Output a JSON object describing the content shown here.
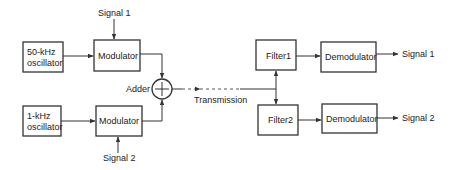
{
  "diagram": {
    "title": "",
    "blocks": {
      "osc1": {
        "line1": "50-kHz",
        "line2": "oscillator"
      },
      "osc2": {
        "line1": "1-kHz",
        "line2": "oscillator"
      },
      "mod1": {
        "label": "Modulator"
      },
      "mod2": {
        "label": "Modulator"
      },
      "adder": {
        "label": "Adder",
        "symbol": "+"
      },
      "filter1": {
        "label": "Filter1"
      },
      "filter2": {
        "label": "Filter2"
      },
      "demod1": {
        "label": "Demodulator"
      },
      "demod2": {
        "label": "Demodulator"
      }
    },
    "signals": {
      "in1": "Signal 1",
      "in2": "Signal 2",
      "out1": "Signal 1",
      "out2": "Signal 2",
      "transmission": "Transmission"
    }
  }
}
